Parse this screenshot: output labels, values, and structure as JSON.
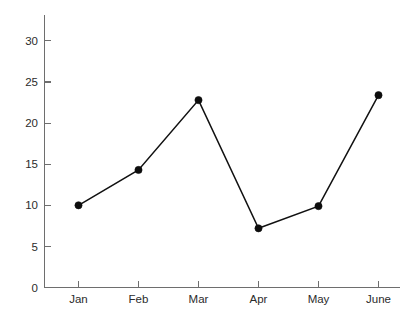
{
  "chart_data": {
    "type": "line",
    "title": "",
    "subtitle": "",
    "xlabel": "",
    "ylabel": "",
    "categories": [
      "Jan",
      "Feb",
      "Mar",
      "Apr",
      "May",
      "June"
    ],
    "values": [
      10.0,
      14.3,
      22.8,
      7.2,
      9.9,
      23.4
    ],
    "series": [
      {
        "name": "",
        "values": [
          10.0,
          14.3,
          22.8,
          7.2,
          9.9,
          23.4
        ]
      }
    ],
    "ylim": [
      0,
      32.5
    ],
    "xlim": [
      0,
      7
    ],
    "y_ticks": [
      0,
      5,
      10,
      15,
      20,
      25,
      30
    ],
    "y_tick_labels": [
      "0",
      "5",
      "10",
      "15",
      "20",
      "25",
      "30"
    ],
    "x_tick_labels": [
      "Jan",
      "Feb",
      "Mar",
      "Apr",
      "May",
      "June"
    ],
    "grid": false,
    "legend": false,
    "legend_position": "none",
    "annotations": [],
    "marker": "circle",
    "line_color": "#111111",
    "marker_color": "#0d0d0d",
    "axis_color": "#6e6e6e",
    "background_color": "#ffffff"
  },
  "axes": {
    "y_axis_name": "y-axis",
    "x_axis_name": "x-axis"
  }
}
